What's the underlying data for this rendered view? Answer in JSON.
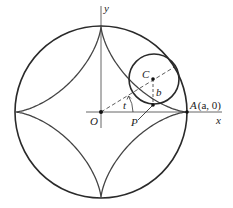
{
  "figure": {
    "type": "hypocycloid-astroid",
    "labels": {
      "y_axis": "y",
      "x_axis": "x",
      "origin": "O",
      "center_small": "C",
      "radius_small": "b",
      "angle": "t",
      "point_p": "P",
      "point_a_name": "A",
      "point_a_coords": "(a, 0)"
    },
    "geometry": {
      "origin_px": [
        101,
        112
      ],
      "big_radius_px": 86,
      "small_radius_px": 25,
      "small_center_px": [
        154,
        79
      ],
      "angle_t_deg": 31
    },
    "colors": {
      "stroke": "#2a2a2a",
      "axis": "#555555",
      "background": "#ffffff"
    }
  }
}
